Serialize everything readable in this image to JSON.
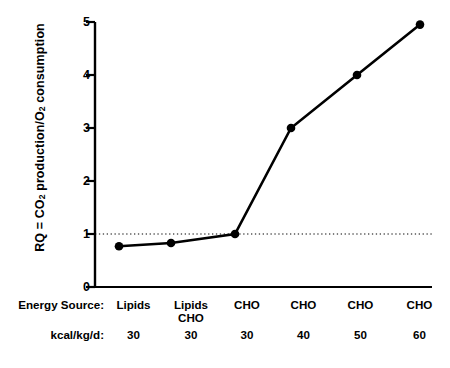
{
  "chart_data": {
    "type": "line",
    "title": "",
    "xlabel": "",
    "ylabel": "RQ = CO2 production/O2 consumption",
    "ylabel_parts": {
      "pre": "RQ = CO",
      "sub1": "2",
      "mid": " production/O",
      "sub2": "2",
      "post": " consumption"
    },
    "ylim": [
      0,
      5
    ],
    "yticks": [
      0,
      1,
      2,
      3,
      4,
      5
    ],
    "ytick_labels": [
      "0",
      "1",
      "2",
      "3",
      "4",
      "5"
    ],
    "grid": false,
    "legend": "none",
    "reference_line": {
      "value": 1,
      "style": "dotted",
      "orientation": "horizontal"
    },
    "categories": [
      "1",
      "2",
      "3",
      "4",
      "5",
      "6"
    ],
    "values": [
      0.77,
      0.83,
      1.0,
      3.0,
      4.0,
      4.95
    ],
    "marker": "filled-circle",
    "line_color": "#000000",
    "marker_color": "#000000"
  },
  "axis_table": {
    "rows": [
      {
        "label": "Energy Source:",
        "cells": [
          {
            "line1": "Lipids",
            "line2": ""
          },
          {
            "line1": "Lipids",
            "line2": "CHO"
          },
          {
            "line1": "CHO",
            "line2": ""
          },
          {
            "line1": "CHO",
            "line2": ""
          },
          {
            "line1": "CHO",
            "line2": ""
          },
          {
            "line1": "CHO",
            "line2": ""
          }
        ]
      },
      {
        "label": "kcal/kg/d:",
        "cells": [
          {
            "line1": "30",
            "line2": ""
          },
          {
            "line1": "30",
            "line2": ""
          },
          {
            "line1": "30",
            "line2": ""
          },
          {
            "line1": "40",
            "line2": ""
          },
          {
            "line1": "50",
            "line2": ""
          },
          {
            "line1": "60",
            "line2": ""
          }
        ]
      }
    ]
  }
}
